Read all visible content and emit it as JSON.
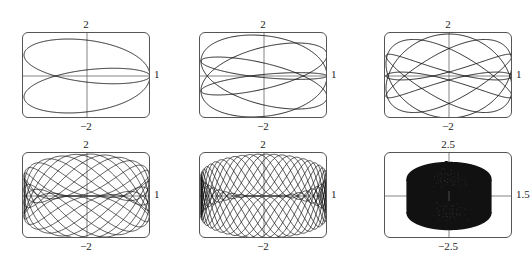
{
  "chart_data": [
    {
      "type": "line",
      "title": "c = 1/2",
      "c_label": "c =",
      "c_fraction": {
        "num": "1",
        "den": "2"
      },
      "c": 0.5,
      "parametric": "x = cos t, y = sin t − sin(ct)",
      "xlim": [
        -1,
        1
      ],
      "ylim": [
        -2,
        2
      ],
      "tick_labels": {
        "left": "−1",
        "right": "1",
        "top": "2",
        "bottom": "−2"
      },
      "t_max": 12.566
    },
    {
      "type": "line",
      "title": "c = 3/4",
      "c_label": "c =",
      "c_fraction": {
        "num": "3",
        "den": "4"
      },
      "c": 0.75,
      "parametric": "x = cos t, y = sin t − sin(ct)",
      "xlim": [
        -1,
        1
      ],
      "ylim": [
        -2,
        2
      ],
      "tick_labels": {
        "left": "−1",
        "right": "1",
        "top": "2",
        "bottom": "−2"
      },
      "t_max": 25.133
    },
    {
      "type": "line",
      "title": "c = 7/5",
      "c_label": "c =",
      "c_fraction": {
        "num": "7",
        "den": "5"
      },
      "c": 1.4,
      "parametric": "x = cos t, y = sin t − sin(ct)",
      "xlim": [
        -1,
        1
      ],
      "ylim": [
        -2,
        2
      ],
      "tick_labels": {
        "left": "−1",
        "right": "1",
        "top": "2",
        "bottom": "−2"
      },
      "t_max": 31.416
    },
    {
      "type": "line",
      "title": "c = 2.3",
      "c_label": "c = 2.3",
      "c": 2.3,
      "parametric": "x = cos t, y = sin t − sin(ct)",
      "xlim": [
        -1,
        1
      ],
      "ylim": [
        -2,
        2
      ],
      "tick_labels": {
        "left": "−1",
        "right": "1",
        "top": "2",
        "bottom": "−2"
      },
      "t_max": 62.832
    },
    {
      "type": "line",
      "title": "c = 4.7",
      "c_label": "c = 4.7",
      "c": 4.7,
      "parametric": "x = cos t, y = sin t − sin(ct)",
      "xlim": [
        -1,
        1
      ],
      "ylim": [
        -2,
        2
      ],
      "tick_labels": {
        "left": "−1",
        "right": "1",
        "top": "2",
        "bottom": "−2"
      },
      "t_max": 62.832
    },
    {
      "type": "line",
      "title": "c = 2.359",
      "c_label": "c = 2.359",
      "c": 2.359,
      "parametric": "x = cos t, y = sin t − sin(ct)",
      "xlim": [
        -1.5,
        1.5
      ],
      "ylim": [
        -2.5,
        2.5
      ],
      "tick_labels": {
        "left": "−1.5",
        "right": "1.5",
        "top": "2.5",
        "bottom": "−2.5"
      },
      "t_max": 2000,
      "filled": true
    }
  ]
}
